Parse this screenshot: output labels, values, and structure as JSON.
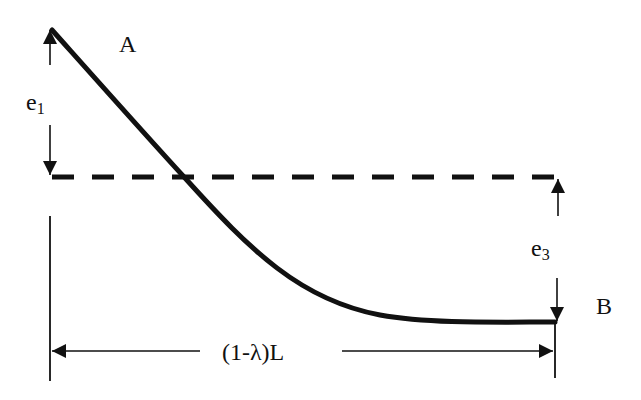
{
  "diagram": {
    "labels": {
      "point_a": "A",
      "point_b": "B",
      "e1_base": "e",
      "e1_sub": "1",
      "e3_base": "e",
      "e3_sub": "3",
      "span": "(1-λ)L"
    },
    "colors": {
      "stroke": "#111111",
      "background": "#ffffff"
    }
  }
}
